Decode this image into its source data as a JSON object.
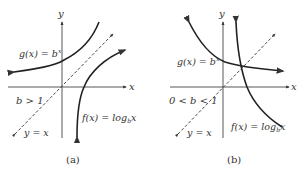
{
  "panels": [
    {
      "id": "a",
      "caption": "(a)",
      "condition": "b > 1",
      "axis_x_label": "x",
      "axis_y_label": "y",
      "exp_label": "g(x) = b",
      "exp_sup": "x",
      "log_label_pre": "f(x) = log",
      "log_sub": "b",
      "log_label_post": "x",
      "identity_label": "y = x"
    },
    {
      "id": "b",
      "caption": "(b)",
      "condition": "0 < b < 1",
      "axis_x_label": "x",
      "axis_y_label": "y",
      "exp_label": "g(x) = b",
      "exp_sup": "x",
      "log_label_pre": "f(x) = log",
      "log_sub": "b",
      "log_label_post": "x",
      "identity_label": "y = x"
    }
  ],
  "colors": {
    "curve": "#222222",
    "axis": "#444444",
    "text": "#333333"
  }
}
